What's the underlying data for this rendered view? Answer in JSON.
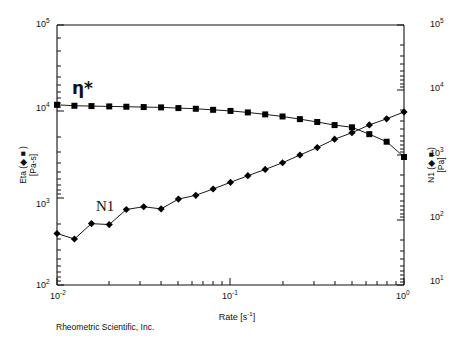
{
  "figure": {
    "footer": "Rheometric Scientific, Inc.",
    "axis_titles": {
      "y_left_line1": "Eta (◆ ■  )",
      "y_left_line2": "[Pa-s]",
      "y_right_line1": "N1 (◆ ■  )",
      "y_right_line2": "[Pa]",
      "x": "Rate [s-1]",
      "x_base": "Rate [s",
      "x_exp": "-1",
      "x_tail": "]"
    },
    "annotations": {
      "eta_star": "η*",
      "n1": "N1"
    },
    "ticks": {
      "y_left": [
        "105",
        "104",
        "103",
        "102"
      ],
      "y_left_base": [
        "10",
        "10",
        "10",
        "10"
      ],
      "y_left_exp": [
        "5",
        "4",
        "3",
        "2"
      ],
      "y_right_base": [
        "10",
        "10",
        "10",
        "10",
        "10"
      ],
      "y_right_exp": [
        "5",
        "4",
        "3",
        "2",
        "1"
      ],
      "x_base": [
        "10",
        "10",
        "10"
      ],
      "x_exp": [
        "-2",
        "-1",
        "0"
      ]
    }
  },
  "chart_data": {
    "type": "line",
    "title": "",
    "subtitle": "",
    "xlabel": "Rate [s-1]",
    "ylabel": "Eta (◆ ■  ) [Pa-s]",
    "y2label": "N1 (◆ ■  ) [Pa]",
    "xscale": "log",
    "yscale": "log",
    "y2scale": "log",
    "xlim": [
      0.01,
      1.0
    ],
    "ylim": [
      100,
      100000
    ],
    "y2lim": [
      10,
      100000
    ],
    "grid": false,
    "legend_position": "inline-annotations",
    "xticks": [
      0.01,
      0.1,
      1.0
    ],
    "xticklabels": [
      "10-2",
      "10-1",
      "100"
    ],
    "yticks": [
      100,
      1000,
      10000,
      100000
    ],
    "yticklabels": [
      "102",
      "103",
      "104",
      "105"
    ],
    "y2ticks": [
      10,
      100,
      1000,
      10000,
      100000
    ],
    "y2ticklabels": [
      "101",
      "102",
      "103",
      "104",
      "105"
    ],
    "series": [
      {
        "name": "η*",
        "axis": "left",
        "marker": "square",
        "color": "#000000",
        "x": [
          0.01,
          0.0126,
          0.0158,
          0.02,
          0.0251,
          0.0316,
          0.0398,
          0.0501,
          0.0631,
          0.0794,
          0.1,
          0.1259,
          0.1585,
          0.1995,
          0.2512,
          0.3162,
          0.3981,
          0.5012,
          0.631,
          0.7943,
          1.0
        ],
        "y": [
          12000,
          11700,
          11600,
          11500,
          11400,
          11300,
          11200,
          11000,
          10800,
          10500,
          10200,
          9800,
          9300,
          8800,
          8200,
          7600,
          7000,
          6600,
          5500,
          4500,
          3000
        ]
      },
      {
        "name": "N1",
        "axis": "right",
        "marker": "diamond",
        "color": "#000000",
        "x": [
          0.01,
          0.0126,
          0.0158,
          0.02,
          0.0251,
          0.0316,
          0.0398,
          0.0501,
          0.0631,
          0.0794,
          0.1,
          0.1259,
          0.1585,
          0.1995,
          0.2512,
          0.3162,
          0.3981,
          0.5012,
          0.631,
          0.7943,
          1.0
        ],
        "y": [
          62,
          51,
          88,
          85,
          145,
          160,
          148,
          210,
          240,
          300,
          380,
          480,
          600,
          760,
          1000,
          1300,
          1750,
          2200,
          2900,
          3600,
          4600
        ]
      }
    ]
  }
}
